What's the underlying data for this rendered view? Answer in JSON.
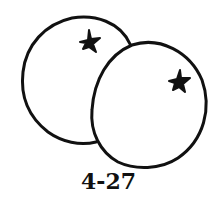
{
  "figure": {
    "label": "4-27",
    "stroke_color": "#111111",
    "background_color": "#ffffff"
  }
}
